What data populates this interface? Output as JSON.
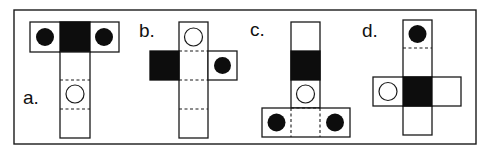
{
  "figure": {
    "colors": {
      "ink": "#1a1a1a",
      "black_face": "#0d0d0d",
      "background": "#ffffff"
    },
    "options": [
      {
        "label": "a.",
        "layout": "T-shape: top row of three squares, vertical column of three squares below center",
        "faces": [
          "filled-dot",
          "black",
          "filled-dot",
          "blank",
          "hollow-dot",
          "blank"
        ]
      },
      {
        "label": "b.",
        "layout": "Vertical column of four squares with one square left (black) and one square right (filled dot) of second square",
        "faces": [
          "hollow-dot",
          "black",
          "blank",
          "filled-dot",
          "blank",
          "blank"
        ]
      },
      {
        "label": "c.",
        "layout": "Inverted T: vertical column of three squares above a bottom row of three squares",
        "faces": [
          "blank",
          "black",
          "hollow-dot",
          "filled-dot",
          "blank",
          "filled-dot"
        ]
      },
      {
        "label": "d.",
        "layout": "Cross: vertical column of four squares with squares left (hollow dot) and right (blank) of third square",
        "faces": [
          "filled-dot",
          "blank",
          "hollow-dot",
          "black",
          "blank",
          "blank"
        ]
      }
    ]
  }
}
